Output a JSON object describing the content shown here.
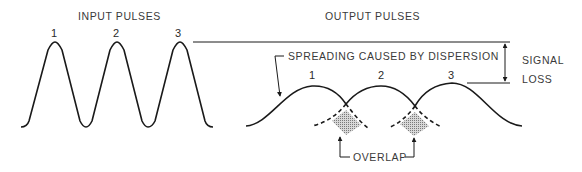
{
  "diagram": {
    "type": "pulse-dispersion-illustration",
    "input": {
      "title": "INPUT PULSES",
      "pulse_labels": [
        "1",
        "2",
        "3"
      ]
    },
    "output": {
      "title": "OUTPUT PULSES",
      "pulse_labels": [
        "1",
        "2",
        "3"
      ],
      "spreading_annotation": "SPREADING CAUSED BY DISPERSION",
      "overlap_annotation": "OVERLAP",
      "signal_loss_annotation": [
        "SIGNAL",
        "LOSS"
      ]
    },
    "colors": {
      "stroke": "#1a1a1a",
      "text": "#3a3a3a",
      "overlap_fill": "#9a9a9a",
      "background": "#ffffff"
    }
  }
}
